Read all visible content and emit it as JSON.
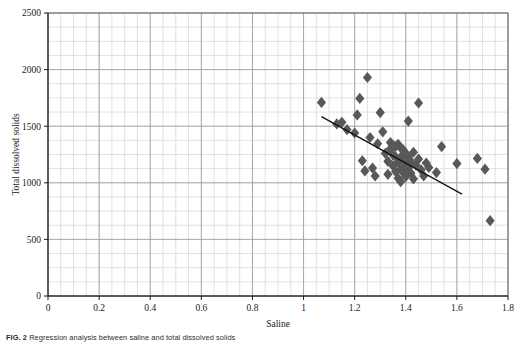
{
  "figure": {
    "caption_label": "FIG. 2",
    "caption_text": "Regression analysis between saline and total dissolved solids"
  },
  "chart_data": {
    "type": "scatter",
    "title": "",
    "xlabel": "Saline",
    "ylabel": "Total dissolved solids",
    "xlim": [
      0,
      1.8
    ],
    "ylim": [
      0,
      2500
    ],
    "xticks": [
      0,
      0.2,
      0.4,
      0.6,
      0.8,
      1,
      1.2,
      1.4,
      1.6,
      1.8
    ],
    "xtick_labels": [
      "0",
      "0.2",
      "0.4",
      "0.6",
      "0.8",
      "1",
      "1.2",
      "1.4",
      "1.6",
      "1.8"
    ],
    "yticks": [
      0,
      500,
      1000,
      1500,
      2000,
      2500
    ],
    "ytick_labels": [
      "0",
      "500",
      "1000",
      "1500",
      "2000",
      "2500"
    ],
    "x_minor_step": 0.05,
    "y_minor_step": 125,
    "grid": true,
    "grid_major_color": "#9a9a9a",
    "grid_minor_color": "#cccccc",
    "legend": "none",
    "marker": "diamond",
    "marker_color": "#58585a",
    "marker_size": 5.6,
    "points": [
      [
        1.07,
        1710
      ],
      [
        1.13,
        1520
      ],
      [
        1.15,
        1535
      ],
      [
        1.17,
        1470
      ],
      [
        1.2,
        1440
      ],
      [
        1.21,
        1600
      ],
      [
        1.22,
        1745
      ],
      [
        1.23,
        1195
      ],
      [
        1.24,
        1105
      ],
      [
        1.25,
        1930
      ],
      [
        1.26,
        1400
      ],
      [
        1.27,
        1130
      ],
      [
        1.28,
        1060
      ],
      [
        1.29,
        1345
      ],
      [
        1.3,
        1620
      ],
      [
        1.31,
        1450
      ],
      [
        1.32,
        1260
      ],
      [
        1.33,
        1190
      ],
      [
        1.33,
        1075
      ],
      [
        1.34,
        1355
      ],
      [
        1.34,
        1300
      ],
      [
        1.35,
        1330
      ],
      [
        1.35,
        1245
      ],
      [
        1.35,
        1150
      ],
      [
        1.36,
        1320
      ],
      [
        1.36,
        1230
      ],
      [
        1.36,
        1100
      ],
      [
        1.37,
        1340
      ],
      [
        1.37,
        1180
      ],
      [
        1.37,
        1040
      ],
      [
        1.38,
        1310
      ],
      [
        1.38,
        1225
      ],
      [
        1.38,
        1120
      ],
      [
        1.38,
        1010
      ],
      [
        1.39,
        1290
      ],
      [
        1.39,
        1205
      ],
      [
        1.39,
        1090
      ],
      [
        1.4,
        1260
      ],
      [
        1.4,
        1160
      ],
      [
        1.4,
        1055
      ],
      [
        1.41,
        1545
      ],
      [
        1.41,
        1230
      ],
      [
        1.41,
        1130
      ],
      [
        1.42,
        1190
      ],
      [
        1.42,
        1085
      ],
      [
        1.43,
        1270
      ],
      [
        1.43,
        1035
      ],
      [
        1.44,
        1155
      ],
      [
        1.45,
        1705
      ],
      [
        1.45,
        1210
      ],
      [
        1.46,
        1115
      ],
      [
        1.47,
        1060
      ],
      [
        1.48,
        1175
      ],
      [
        1.49,
        1135
      ],
      [
        1.52,
        1090
      ],
      [
        1.54,
        1320
      ],
      [
        1.6,
        1170
      ],
      [
        1.68,
        1215
      ],
      [
        1.71,
        1120
      ],
      [
        1.73,
        665
      ]
    ],
    "trendline": {
      "x_start": 1.07,
      "y_start": 1585,
      "x_end": 1.62,
      "y_end": 900,
      "color": "#111111",
      "width": 1.3
    }
  }
}
